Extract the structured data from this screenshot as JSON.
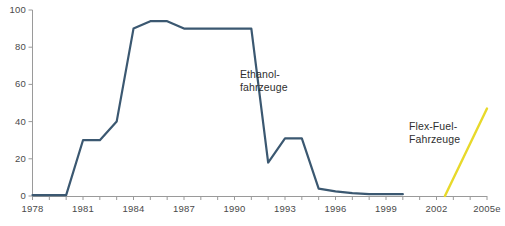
{
  "chart_data": {
    "type": "line",
    "title": "",
    "xlabel": "",
    "ylabel": "",
    "xlim": [
      1978,
      2005
    ],
    "ylim": [
      0,
      100
    ],
    "grid": false,
    "legend_position": "inline-annotation",
    "y_ticks": [
      0,
      20,
      40,
      60,
      80,
      100
    ],
    "y_tick_labels": [
      "0",
      "20",
      "40",
      "60",
      "80",
      "100"
    ],
    "x_ticks": [
      1978,
      1979,
      1980,
      1981,
      1982,
      1983,
      1984,
      1985,
      1986,
      1987,
      1988,
      1989,
      1990,
      1991,
      1992,
      1993,
      1994,
      1995,
      1996,
      1997,
      1998,
      1999,
      2000,
      2001,
      2002,
      2003,
      2004,
      2005
    ],
    "x_tick_labels": [
      "1978",
      "1981",
      "1984",
      "1987",
      "1990",
      "1993",
      "1996",
      "1999",
      "2002",
      "2005e"
    ],
    "x_labeled_ticks": [
      1978,
      1981,
      1984,
      1987,
      1990,
      1993,
      1996,
      1999,
      2002,
      2005
    ],
    "series": [
      {
        "name": "Ethanol-fahrzeuge",
        "color": "#3b5871",
        "label_line1": "Ethanol-",
        "label_line2": "fahrzeuge",
        "x": [
          1978,
          1979,
          1980,
          1981,
          1982,
          1983,
          1984,
          1985,
          1986,
          1987,
          1988,
          1989,
          1990,
          1991,
          1992,
          1993,
          1994,
          1995,
          1996,
          1997,
          1998,
          1999,
          2000
        ],
        "values": [
          0.5,
          0.5,
          0.5,
          30,
          30,
          40,
          90,
          94,
          94,
          90,
          90,
          90,
          90,
          90,
          18,
          31,
          31,
          4,
          2.5,
          1.5,
          1,
          1,
          1
        ]
      },
      {
        "name": "Flex-Fuel-Fahrzeuge",
        "color": "#e8d92a",
        "label_line1": "Flex-Fuel-",
        "label_line2": "Fahrzeuge",
        "x": [
          2002.5,
          2005
        ],
        "values": [
          0,
          47
        ]
      }
    ]
  }
}
